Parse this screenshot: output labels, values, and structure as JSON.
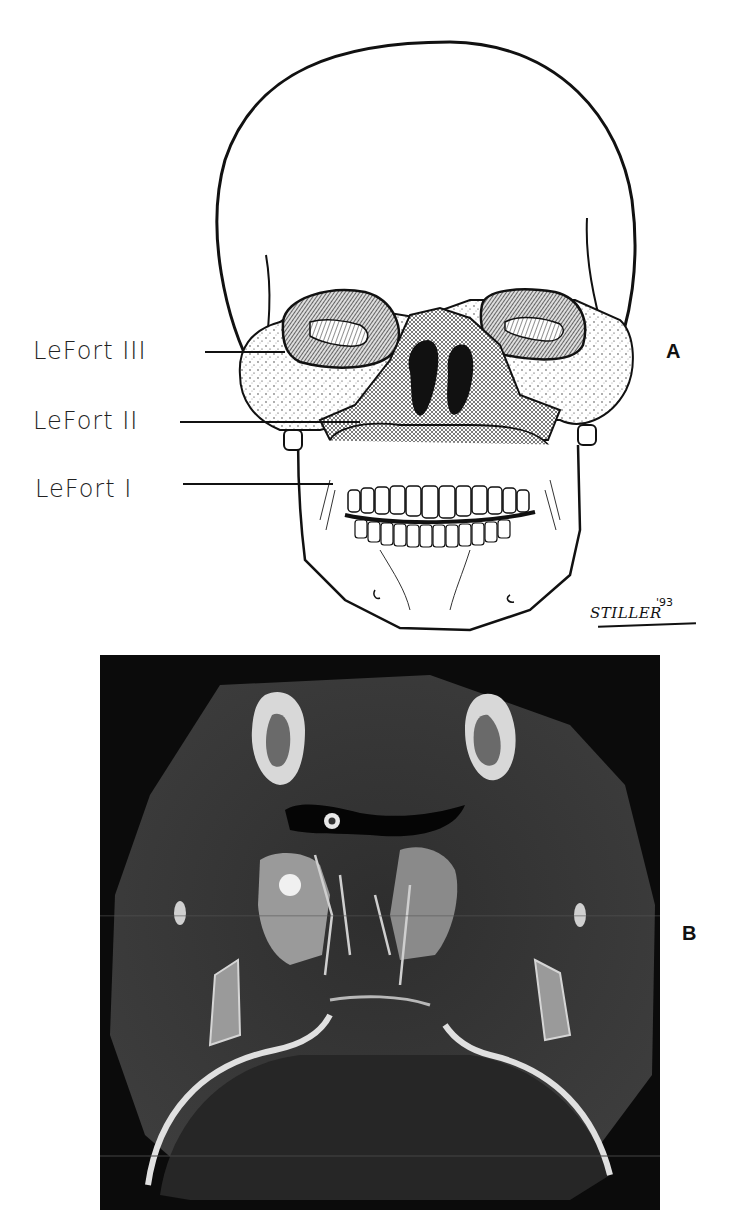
{
  "figure": {
    "panel_a": {
      "letter": "A",
      "description": "Frontal skull illustration showing LeFort fracture lines",
      "labels": [
        {
          "text": "LeFort III",
          "level": "III"
        },
        {
          "text": "LeFort II",
          "level": "II"
        },
        {
          "text": "LeFort I",
          "level": "I"
        }
      ],
      "signature": {
        "name": "STILLER",
        "year": "'93"
      }
    },
    "panel_b": {
      "letter": "B",
      "description": "Axial CT scan image of the midface"
    },
    "colors": {
      "ink": "#111111",
      "paper": "#ffffff",
      "ct_background": "#0a0a0a",
      "ct_tissue": "#3a3a3a",
      "ct_bone": "#e8e8e8"
    }
  }
}
